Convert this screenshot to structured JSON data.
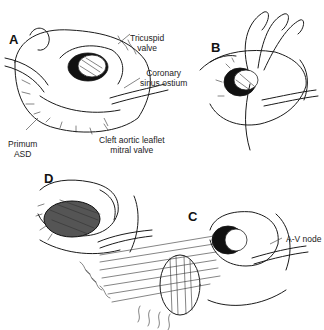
{
  "figure": {
    "panels": [
      {
        "id": "A",
        "label": "A"
      },
      {
        "id": "B",
        "label": "B"
      },
      {
        "id": "C",
        "label": "C"
      },
      {
        "id": "D",
        "label": "D"
      }
    ],
    "annotations": {
      "tricuspid_valve": {
        "line1": "Tricuspid",
        "line2": "valve"
      },
      "coronary_sinus": {
        "line1": "Coronary",
        "line2": "sinus ostium"
      },
      "primum_asd": {
        "line1": "Primum",
        "line2": "ASD"
      },
      "cleft_leaflet": {
        "line1": "Cleft aortic leaflet",
        "line2": "mitral valve"
      },
      "av_node": {
        "line1": "A-V node"
      }
    }
  }
}
